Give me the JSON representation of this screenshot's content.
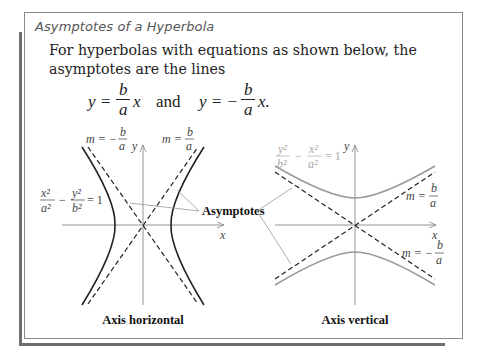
{
  "box": {
    "title": "Asymptotes of a Hyperbola",
    "paragraph": "For hyperbolas with equations as shown below, the asymptotes are the lines",
    "equation": {
      "lhs1": "y =",
      "num1": "b",
      "den1": "a",
      "var1": "x",
      "conj": "and",
      "lhs2": "y = −",
      "num2": "b",
      "den2": "a",
      "var2": "x."
    }
  },
  "left_figure": {
    "caption": "Axis horizontal",
    "equation": {
      "n1": "x²",
      "d1": "a²",
      "op": "−",
      "n2": "y²",
      "d2": "b²",
      "rhs": "= 1"
    },
    "slope_neg": {
      "m": "m = −",
      "num": "b",
      "den": "a"
    },
    "slope_pos": {
      "m": "m =",
      "num": "b",
      "den": "a"
    },
    "x_axis_label": "x",
    "y_axis_label": "y"
  },
  "right_figure": {
    "caption": "Axis vertical",
    "equation": {
      "n1": "y²",
      "d1": "b²",
      "op": "−",
      "n2": "x²",
      "d2": "a²",
      "rhs": "= 1"
    },
    "slope_pos": {
      "m": "m =",
      "num": "b",
      "den": "a"
    },
    "slope_neg": {
      "m": "m = −",
      "num": "b",
      "den": "a"
    },
    "x_axis_label": "x",
    "y_axis_label": "y"
  },
  "shared_label": "Asymptotes",
  "colors": {
    "frame": "#8a8a8a",
    "accent_bar": "#6e6e6e",
    "curve_dark": "#222222",
    "curve_gray": "#9a9a9a",
    "axis": "#888888"
  }
}
